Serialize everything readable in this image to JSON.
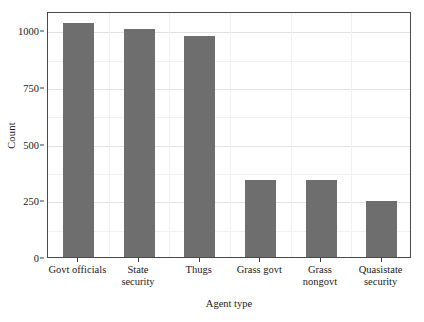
{
  "chart_data": {
    "type": "bar",
    "title": "",
    "xlabel": "Agent type",
    "ylabel": "Count",
    "categories": [
      "Govt officials",
      "State security",
      "Thugs",
      "Grass govt",
      "Grass nongovt",
      "Quasistate security"
    ],
    "category_lines": [
      [
        "Govt officials"
      ],
      [
        "State",
        "security"
      ],
      [
        "Thugs"
      ],
      [
        "Grass govt"
      ],
      [
        "Grass",
        "nongovt"
      ],
      [
        "Quasistate",
        "security"
      ]
    ],
    "values": [
      1030,
      1005,
      975,
      340,
      338,
      245
    ],
    "ylim": [
      0,
      1085
    ],
    "yticks": [
      0,
      250,
      500,
      750,
      1000
    ],
    "ytick_labels": [
      "0",
      "250",
      "500",
      "750",
      "1000"
    ],
    "grid": true,
    "legend": "none",
    "bar_color": "#6e6e6e",
    "panel_background": "#ffffff",
    "panel_border_color": "#4a4a4a",
    "gridline_color": "#e2e2e2"
  }
}
